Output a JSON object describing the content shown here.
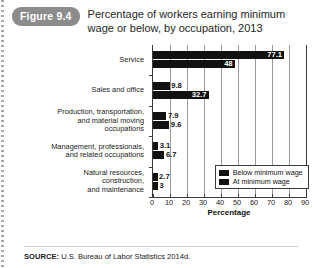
{
  "figure": {
    "badge": "Figure 9.4",
    "title": "Percentage of workers earning minimum wage or below, by occupation, 2013"
  },
  "source": {
    "label": "SOURCE:",
    "text": "U.S. Bureau of Labor Statistics 2014d."
  },
  "legend": {
    "position": "inside-bottom-right",
    "items": [
      {
        "label": "Below minimum wage",
        "color": "#111111"
      },
      {
        "label": "At minimum wage",
        "color": "#111111"
      }
    ]
  },
  "axis": {
    "x_title": "Percentage",
    "x_ticks": [
      "0",
      "10",
      "20",
      "30",
      "40",
      "50",
      "60",
      "70",
      "80",
      "90"
    ]
  },
  "chart_data": {
    "type": "bar",
    "orientation": "horizontal",
    "title": "Percentage of workers earning minimum wage or below, by occupation, 2013",
    "xlabel": "Percentage",
    "ylabel": "",
    "xlim": [
      0,
      90
    ],
    "grid": true,
    "categories": [
      "Service",
      "Sales and office",
      "Production, transportation, and material moving occupations",
      "Management, professionals, and related occupations",
      "Natural resources, construction, and maintenance"
    ],
    "category_lines": [
      [
        "Service"
      ],
      [
        "Sales and office"
      ],
      [
        "Production, transportation,",
        "and material moving",
        "occupations"
      ],
      [
        "Management, professionals,",
        "and related occupations"
      ],
      [
        "Natural resources,",
        "construction,",
        "and maintenance"
      ]
    ],
    "series": [
      {
        "name": "Below minimum wage",
        "values": [
          77.1,
          9.8,
          7.9,
          3.1,
          2.7
        ],
        "labels": [
          "77.1",
          "9.8",
          "7.9",
          "3.1",
          "2.7"
        ]
      },
      {
        "name": "At minimum wage",
        "values": [
          48,
          32.7,
          9.6,
          6.7,
          3
        ],
        "labels": [
          "48",
          "32.7",
          "9.6",
          "6.7",
          "3"
        ]
      }
    ]
  }
}
